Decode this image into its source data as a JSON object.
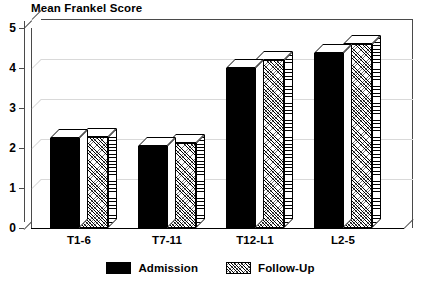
{
  "chart_data": {
    "type": "bar",
    "title": "Mean Frankel Score",
    "subtitle": "",
    "xlabel": "",
    "ylabel": "",
    "categories": [
      "T1-6",
      "T7-11",
      "T12-L1",
      "L2-5"
    ],
    "series": [
      {
        "name": "Admission",
        "values": [
          2.25,
          2.05,
          4.0,
          4.37
        ],
        "color": "#000000",
        "fill": "solid-black"
      },
      {
        "name": "Follow-Up",
        "values": [
          2.27,
          2.12,
          4.2,
          4.6
        ],
        "color": "#ffffff",
        "fill": "diagonal-hatch"
      }
    ],
    "ylim": [
      0,
      5
    ],
    "ytick_labels": [
      "0",
      "1",
      "2",
      "3",
      "4",
      "5"
    ],
    "ytick_values": [
      0,
      1,
      2,
      3,
      4,
      5
    ],
    "grid": true,
    "grid_color": "#d9d9d9",
    "legend_position": "bottom-center",
    "style": "3d-bars",
    "axis_color": "#4a4a4a",
    "baseline_color": "#000000"
  },
  "legend": {
    "entries": [
      {
        "label": "Admission",
        "swatch": "solid-black-swatch"
      },
      {
        "label": "Follow-Up",
        "swatch": "hatched-swatch"
      }
    ]
  }
}
